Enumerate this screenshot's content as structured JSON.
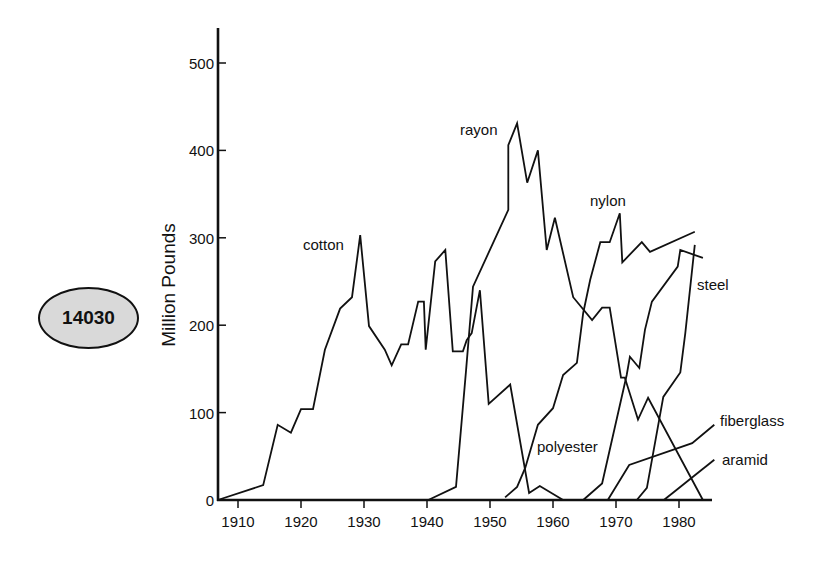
{
  "badge": {
    "text": "14030"
  },
  "chart_data": {
    "type": "line",
    "title": "",
    "xlabel": "",
    "ylabel": "Million Pounds",
    "xlim": [
      1907,
      1986
    ],
    "ylim": [
      0,
      540
    ],
    "grid": false,
    "legend": "inline labels",
    "x_ticks": [
      1910,
      1920,
      1930,
      1940,
      1950,
      1960,
      1970,
      1980
    ],
    "y_ticks": [
      0,
      100,
      200,
      300,
      400,
      500
    ],
    "series": [
      {
        "name": "cotton",
        "points": [
          [
            1906.8,
            0
          ],
          [
            1914,
            17
          ],
          [
            1916.3,
            86
          ],
          [
            1918.4,
            77
          ],
          [
            1920,
            104
          ],
          [
            1921.9,
            104
          ],
          [
            1923.8,
            172
          ],
          [
            1926.2,
            219
          ],
          [
            1928.1,
            232
          ],
          [
            1929.4,
            303
          ],
          [
            1930.8,
            199
          ],
          [
            1933.3,
            172
          ],
          [
            1934.4,
            154
          ],
          [
            1935.9,
            178
          ],
          [
            1937,
            178
          ],
          [
            1938.6,
            227
          ],
          [
            1939.5,
            227
          ],
          [
            1939.8,
            172
          ],
          [
            1941.3,
            273
          ],
          [
            1942.9,
            286
          ],
          [
            1944.1,
            170
          ],
          [
            1945.7,
            170
          ],
          [
            1946.3,
            183
          ],
          [
            1947.1,
            191
          ],
          [
            1948.4,
            240
          ],
          [
            1949.8,
            110
          ],
          [
            1953.2,
            132
          ],
          [
            1956.2,
            8
          ],
          [
            1957.9,
            16
          ],
          [
            1961.6,
            0
          ]
        ]
      },
      {
        "name": "rayon",
        "points": [
          [
            1940.2,
            0
          ],
          [
            1944.6,
            15
          ],
          [
            1946.2,
            149
          ],
          [
            1947.3,
            244
          ],
          [
            1952.9,
            332
          ],
          [
            1952.9,
            406
          ],
          [
            1954.3,
            431
          ],
          [
            1955.9,
            363
          ],
          [
            1957.6,
            400
          ],
          [
            1959,
            286
          ],
          [
            1960.3,
            323
          ],
          [
            1963.2,
            232
          ],
          [
            1966.2,
            206
          ],
          [
            1967.8,
            220
          ],
          [
            1969,
            220
          ],
          [
            1970.8,
            140
          ],
          [
            1971.4,
            140
          ],
          [
            1973.5,
            92
          ],
          [
            1975.1,
            117
          ],
          [
            1983.8,
            0
          ]
        ]
      },
      {
        "name": "nylon",
        "points": [
          [
            1952.4,
            3
          ],
          [
            1954.3,
            15
          ],
          [
            1955.6,
            37
          ],
          [
            1957.6,
            86
          ],
          [
            1960,
            105
          ],
          [
            1961.6,
            143
          ],
          [
            1963.8,
            157
          ],
          [
            1964.8,
            214
          ],
          [
            1965.9,
            252
          ],
          [
            1967.5,
            295
          ],
          [
            1969,
            295
          ],
          [
            1970.6,
            328
          ],
          [
            1971,
            272
          ],
          [
            1974.1,
            295
          ],
          [
            1975.4,
            284
          ],
          [
            1982.5,
            307
          ]
        ]
      },
      {
        "name": "polyester",
        "points": [
          [
            1964.8,
            0
          ],
          [
            1967.8,
            19
          ],
          [
            1971.7,
            143
          ],
          [
            1972.2,
            164
          ],
          [
            1973.7,
            151
          ],
          [
            1974.6,
            195
          ],
          [
            1975.7,
            227
          ],
          [
            1979.8,
            267
          ],
          [
            1980.2,
            286
          ],
          [
            1983.8,
            277
          ]
        ]
      },
      {
        "name": "steel",
        "points": [
          [
            1973.3,
            0
          ],
          [
            1974.9,
            14
          ],
          [
            1977.5,
            118
          ],
          [
            1980.2,
            146
          ],
          [
            1981,
            191
          ],
          [
            1982.5,
            292
          ]
        ]
      },
      {
        "name": "fiberglass",
        "points": [
          [
            1968.7,
            0
          ],
          [
            1972.1,
            40
          ],
          [
            1982.1,
            65
          ],
          [
            1985.6,
            86
          ]
        ]
      },
      {
        "name": "aramid",
        "points": [
          [
            1977.6,
            0
          ],
          [
            1985.6,
            46
          ]
        ]
      }
    ],
    "labels": [
      {
        "text": "cotton",
        "x": 303,
        "y": 236
      },
      {
        "text": "rayon",
        "x": 460,
        "y": 121
      },
      {
        "text": "nylon",
        "x": 590,
        "y": 192
      },
      {
        "text": "steel",
        "x": 697,
        "y": 276
      },
      {
        "text": "polyester",
        "x": 537,
        "y": 438
      },
      {
        "text": "fiberglass",
        "x": 720,
        "y": 412
      },
      {
        "text": "aramid",
        "x": 722,
        "y": 451
      }
    ]
  }
}
